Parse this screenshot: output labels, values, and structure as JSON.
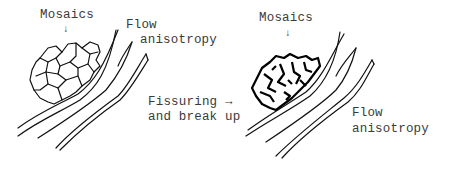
{
  "panels": [
    {
      "name": "intact",
      "labels": {
        "mosaics": "Mosaics",
        "arrow": "↓",
        "flow": "Flow",
        "anisotropy": "anisotropy"
      }
    },
    {
      "name": "fissured",
      "labels": {
        "mosaics": "Mosaics",
        "arrow": "↓",
        "fissuring": "Fissuring →",
        "break_up": "and break up",
        "flow": "Flow",
        "anisotropy": "anisotropy"
      }
    }
  ]
}
